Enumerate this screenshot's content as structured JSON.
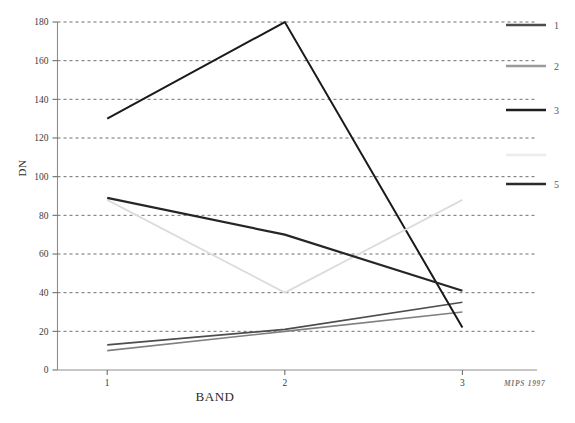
{
  "chart_data": {
    "type": "line",
    "title": "",
    "subtitle": "",
    "xlabel": "BAND",
    "ylabel": "DN",
    "x": [
      1,
      2,
      3
    ],
    "categories": [
      "1",
      "2",
      "3"
    ],
    "xtick_labels": [
      "1",
      "2",
      "3"
    ],
    "ytick_labels": [
      "0",
      "20",
      "40",
      "60",
      "80",
      "100",
      "120",
      "140",
      "160",
      "180"
    ],
    "yticks": [
      0,
      20,
      40,
      60,
      80,
      100,
      120,
      140,
      160,
      180
    ],
    "xlim": [
      0.72,
      3.42
    ],
    "ylim": [
      0,
      180
    ],
    "grid": true,
    "grid_style": "dashed-horizontal",
    "legend_position": "right",
    "series": [
      {
        "name": "1",
        "label": "1",
        "values": [
          13,
          21,
          35
        ],
        "color": "#4d4d4d",
        "width": 1.6
      },
      {
        "name": "2",
        "label": "2",
        "values": [
          10,
          20,
          30
        ],
        "color": "#808080",
        "width": 1.6
      },
      {
        "name": "3",
        "label": "3",
        "values": [
          130,
          180,
          22
        ],
        "color": "#1a1a1a",
        "width": 2.0
      },
      {
        "name": "4",
        "label": "",
        "values": [
          88,
          40,
          88
        ],
        "color": "#dcdcdc",
        "width": 1.8
      },
      {
        "name": "5",
        "label": "5",
        "values": [
          89,
          70,
          41
        ],
        "color": "#262626",
        "width": 2.2
      }
    ],
    "annotations": [
      {
        "name": "watermark",
        "text": "MIPS 1997"
      }
    ]
  },
  "legend": {
    "entries": [
      {
        "label": "1",
        "color": "#4d4d4d"
      },
      {
        "label": "2",
        "color": "#9a9a9a"
      },
      {
        "label": "3",
        "color": "#1f1f1f"
      },
      {
        "label": "",
        "color": "#ececec"
      },
      {
        "label": "5",
        "color": "#2b2b2b"
      }
    ]
  },
  "axes": {
    "x_title": "BAND",
    "y_title": "DN"
  },
  "footer": {
    "watermark": "MIPS 1997"
  }
}
